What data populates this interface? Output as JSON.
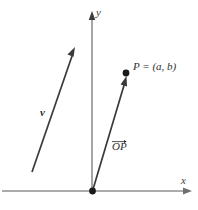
{
  "figure": {
    "width": 198,
    "height": 210,
    "background": "#ffffff",
    "axis_color": "#8f8f8f",
    "vector_color": "#333333",
    "point_color": "#1a1a1a"
  },
  "axes": {
    "x_label": "x",
    "y_label": "y",
    "x_axis": {
      "x1": 2,
      "y1": 191,
      "x2": 192,
      "y2": 191,
      "arrow": "right"
    },
    "y_axis": {
      "x1": 92,
      "y1": 191,
      "x2": 92,
      "y2": 12,
      "arrow": "up"
    }
  },
  "origin": {
    "label": "",
    "x": 92,
    "y": 191
  },
  "vectors": [
    {
      "name": "v",
      "label": "v",
      "label_style": "bold-italic",
      "x1": 32,
      "y1": 172,
      "x2": 74,
      "y2": 50,
      "arrow": "head-at-tip"
    },
    {
      "name": "OP",
      "label": "OP",
      "label_style": "italic-overarrow",
      "x1": 92,
      "y1": 191,
      "x2": 126,
      "y2": 78,
      "arrow": "head-at-tip"
    }
  ],
  "points": [
    {
      "name": "P",
      "label": "P = (a, b)",
      "x": 126,
      "y": 73
    }
  ]
}
